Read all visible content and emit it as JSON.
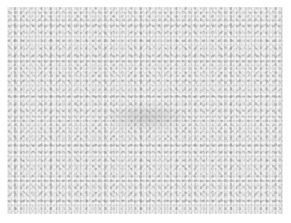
{
  "image": {
    "description": "grayscale noise texture",
    "colors": {
      "background": "#ffffff",
      "texture_base": "#d6d6d6"
    }
  }
}
